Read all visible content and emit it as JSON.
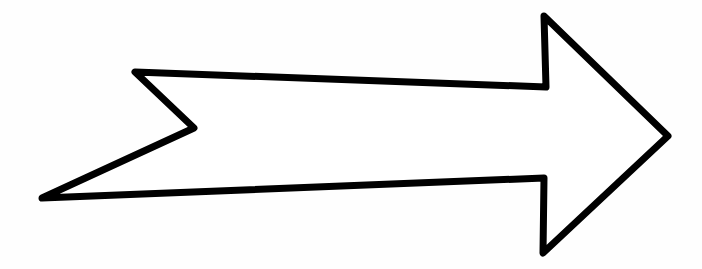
{
  "image": {
    "description": "Hand-drawn outline of a right-pointing arrow with a notched tail",
    "background_color": "#fefefe",
    "stroke_color": "#000000",
    "fill_color": "#ffffff",
    "stroke_width": 7,
    "arrow": {
      "direction": "right",
      "points": [
        [
          135,
          72
        ],
        [
          546,
          87
        ],
        [
          544,
          16
        ],
        [
          668,
          136
        ],
        [
          543,
          253
        ],
        [
          544,
          178
        ],
        [
          42,
          198
        ],
        [
          194,
          128
        ]
      ]
    }
  }
}
